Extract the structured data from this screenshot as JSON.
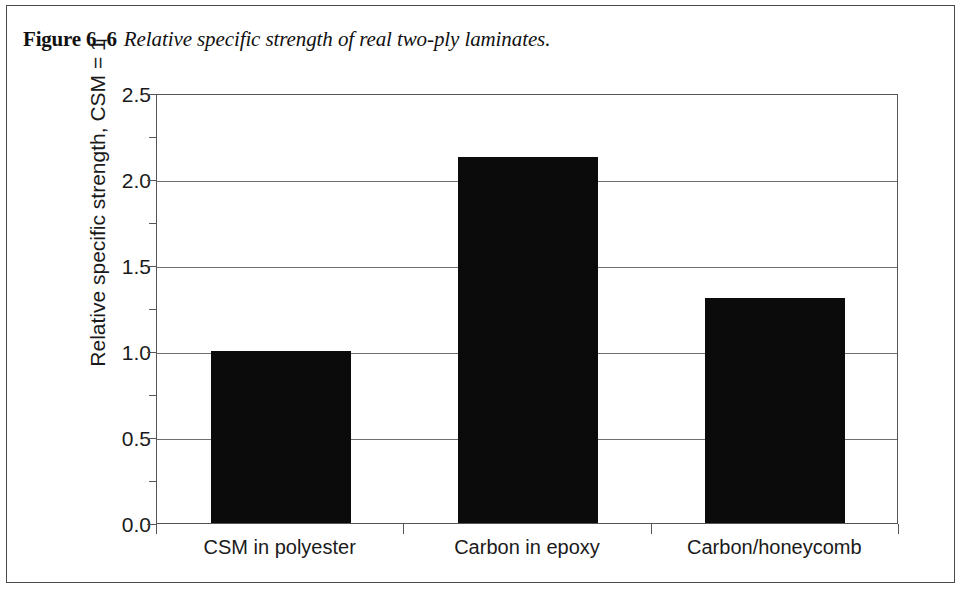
{
  "figure": {
    "label": "Figure 6–6",
    "caption": "Relative specific strength of real two-ply laminates."
  },
  "colors": {
    "bar": "#0b0b0b",
    "grid": "#6f6f6f",
    "axis": "#555555",
    "frame": "#4a4a4a",
    "background": "#ffffff",
    "text": "#1a1a1a"
  },
  "chart_data": {
    "type": "bar",
    "title": "Relative specific strength of real two-ply laminates.",
    "categories": [
      "CSM in polyester",
      "Carbon in epoxy",
      "Carbon/honeycomb"
    ],
    "values": [
      1.0,
      2.13,
      1.31
    ],
    "xlabel": "",
    "ylabel": "Relative specific strength, CSM = 1",
    "ylim": [
      0.0,
      2.5
    ],
    "ytick_labels": [
      "0.0",
      "0.5",
      "1.0",
      "1.5",
      "2.0",
      "2.5"
    ],
    "ytick_values": [
      0.0,
      0.5,
      1.0,
      1.5,
      2.0,
      2.5
    ],
    "yminor_tick_values": [
      0.25,
      0.75,
      1.25,
      1.75,
      2.25
    ],
    "grid": true,
    "legend": "none"
  }
}
